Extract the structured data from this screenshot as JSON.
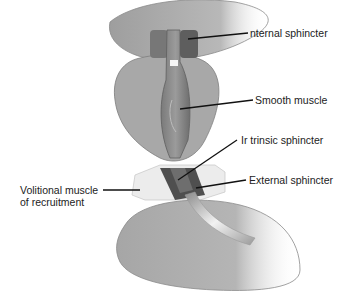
{
  "diagram": {
    "type": "anatomical-illustration",
    "labels": {
      "internal_sphincter": "nternal sphincter",
      "smooth_muscle": "Smooth muscle",
      "intrinsic_sphincter": "Ir trinsic sphincter",
      "external_sphincter": "External sphincter",
      "volitional_line1": "Volitional muscle",
      "volitional_line2": "of recruitment"
    },
    "colors": {
      "tissue": "#a9a9a9",
      "tissue_dark": "#7d7d7d",
      "sphincter": "#5a5a5a",
      "translucent_muscle": "#e6e6e6",
      "leader_line": "#111111",
      "text": "#222222"
    }
  }
}
